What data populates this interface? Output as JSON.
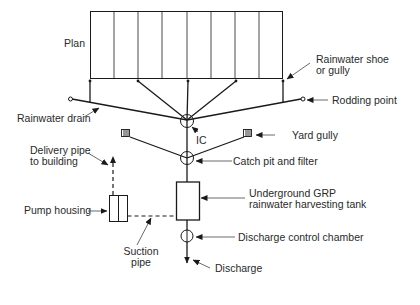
{
  "diagram": {
    "type": "rainwater harvesting drainage layout",
    "colors": {
      "line": "#1a1a1a",
      "leader": "#555555",
      "text": "#2a2a2a",
      "background": "#ffffff"
    },
    "labels": {
      "plan": "Plan",
      "rainwater_shoe_line1": "Rainwater shoe",
      "rainwater_shoe_line2": "or gully",
      "rodding_point": "Rodding point",
      "rainwater_drain": "Rainwater drain",
      "ic": "IC",
      "yard_gully": "Yard gully",
      "catch_pit": "Catch pit and filter",
      "delivery_pipe_line1": "Delivery pipe",
      "delivery_pipe_line2": "to building",
      "tank_line1": "Underground GRP",
      "tank_line2": "rainwater harvesting tank",
      "pump_housing": "Pump housing",
      "discharge_chamber": "Discharge control chamber",
      "suction_pipe_line1": "Suction",
      "suction_pipe_line2": "pipe",
      "discharge": "Discharge"
    },
    "components": [
      {
        "id": "plan",
        "name": "Building plan (roof)",
        "bays": 8
      },
      {
        "id": "rainwater_shoes",
        "name": "Rainwater shoe or gully",
        "count": 5
      },
      {
        "id": "rodding_points",
        "name": "Rodding point",
        "count": 2
      },
      {
        "id": "ic",
        "name": "Inspection chamber (IC)"
      },
      {
        "id": "yard_gullies",
        "name": "Yard gully",
        "count": 2
      },
      {
        "id": "catch_pit",
        "name": "Catch pit and filter"
      },
      {
        "id": "tank",
        "name": "Underground GRP rainwater harvesting tank"
      },
      {
        "id": "pump",
        "name": "Pump housing"
      },
      {
        "id": "discharge_chamber",
        "name": "Discharge control chamber"
      }
    ],
    "connections": [
      {
        "from": "rainwater_shoes",
        "to": "ic",
        "style": "solid"
      },
      {
        "from": "rodding_points",
        "to": "ic",
        "style": "solid"
      },
      {
        "from": "ic",
        "to": "catch_pit",
        "style": "solid"
      },
      {
        "from": "yard_gullies",
        "to": "catch_pit",
        "style": "solid"
      },
      {
        "from": "catch_pit",
        "to": "tank",
        "style": "solid"
      },
      {
        "from": "tank",
        "to": "discharge_chamber",
        "style": "solid"
      },
      {
        "from": "discharge_chamber",
        "to": "discharge",
        "style": "solid"
      },
      {
        "from": "tank",
        "to": "pump",
        "style": "dashed",
        "label": "Suction pipe"
      },
      {
        "from": "pump",
        "to": "building",
        "style": "dashed",
        "label": "Delivery pipe to building"
      }
    ]
  }
}
